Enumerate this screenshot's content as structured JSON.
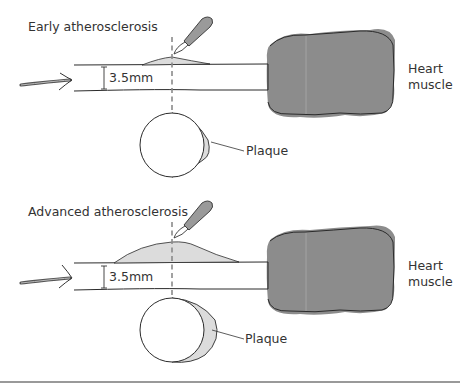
{
  "figure": {
    "panels": [
      {
        "id": "early",
        "title": "Early atherosclerosis",
        "diameter_label": "3.5mm",
        "heart_label_line1": "Heart",
        "heart_label_line2": "muscle",
        "plaque_label": "Plaque",
        "plaque_extent": "small"
      },
      {
        "id": "advanced",
        "title": "Advanced atherosclerosis",
        "diameter_label": "3.5mm",
        "heart_label_line1": "Heart",
        "heart_label_line2": "muscle",
        "plaque_label": "Plaque",
        "plaque_extent": "large"
      }
    ],
    "icons": [
      "blood-flow-arrow-icon",
      "scalpel-icon",
      "cross-section-circle-icon"
    ],
    "colors": {
      "heart_fill": "#8c8c8c",
      "plaque_fill": "#dcdcdc",
      "line": "#2b2b2b",
      "scalpel_fill": "#9a9a9a",
      "cut_line": "#8a8a8a",
      "text": "#333333"
    }
  }
}
